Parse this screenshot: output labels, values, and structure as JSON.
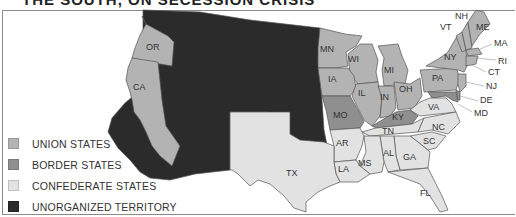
{
  "title": "THE SOUTH, ON SECESSION CRISIS",
  "colors": {
    "union": "#b3b3b3",
    "border": "#8f8f8f",
    "confederate": "#e2e2e2",
    "unorganized": "#2b2b2b",
    "outline": "#555555",
    "background": "#ffffff"
  },
  "legend": [
    {
      "label": "UNION STATES",
      "category": "union"
    },
    {
      "label": "BORDER STATES",
      "category": "border"
    },
    {
      "label": "CONFEDERATE STATES",
      "category": "confederate"
    },
    {
      "label": "UNORGANIZED TERRITORY",
      "category": "unorganized"
    }
  ],
  "states": {
    "union": [
      "OR",
      "CA",
      "MN",
      "WI",
      "IA",
      "MI",
      "IL",
      "IN",
      "OH",
      "PA",
      "NY",
      "VT",
      "NH",
      "ME",
      "MA",
      "RI",
      "CT",
      "NJ"
    ],
    "border": [
      "MO",
      "KY",
      "MD",
      "DE"
    ],
    "confederate": [
      "TX",
      "AR",
      "LA",
      "MS",
      "AL",
      "GA",
      "FL",
      "TN",
      "NC",
      "SC",
      "VA"
    ]
  },
  "labels": {
    "OR": "OR",
    "CA": "CA",
    "MN": "MN",
    "WI": "WI",
    "IA": "IA",
    "MI": "MI",
    "IL": "IL",
    "IN": "IN",
    "OH": "OH",
    "PA": "PA",
    "NY": "NY",
    "VT": "VT",
    "NH": "NH",
    "ME": "ME",
    "MA": "MA",
    "RI": "RI",
    "CT": "CT",
    "NJ": "NJ",
    "DE": "DE",
    "MD": "MD",
    "MO": "MO",
    "KY": "KY",
    "TX": "TX",
    "AR": "AR",
    "LA": "LA",
    "MS": "MS",
    "AL": "AL",
    "GA": "GA",
    "FL": "FL",
    "TN": "TN",
    "NC": "NC",
    "SC": "SC",
    "VA": "VA"
  }
}
